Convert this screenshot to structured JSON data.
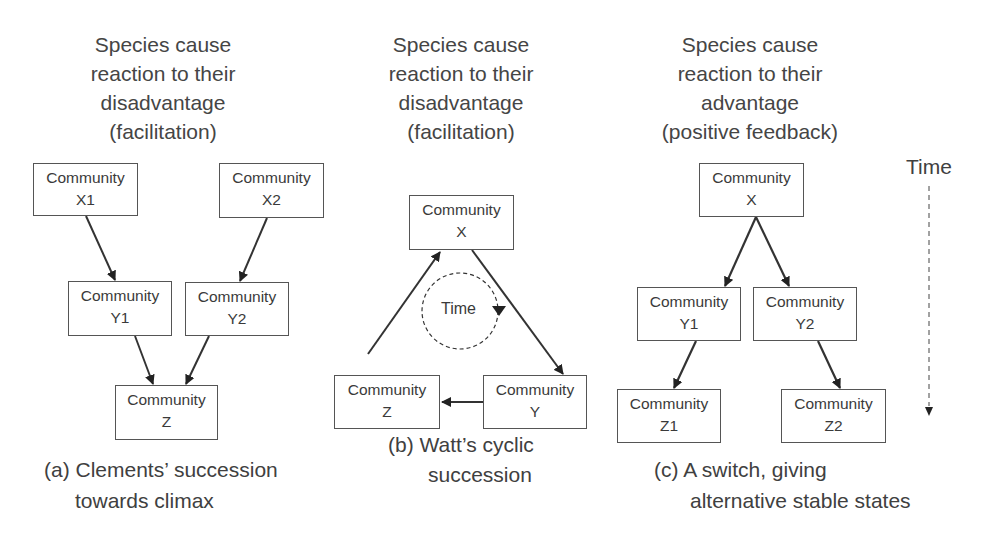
{
  "panels": [
    {
      "id": "a",
      "heading": "Species cause\nreaction to their\ndisadvantage\n(facilitation)",
      "caption_line1": "(a) Clements’ succession",
      "caption_line2": "towards climax",
      "nodes": [
        {
          "id": "X1",
          "title": "Community",
          "label": "X1"
        },
        {
          "id": "X2",
          "title": "Community",
          "label": "X2"
        },
        {
          "id": "Y1",
          "title": "Community",
          "label": "Y1"
        },
        {
          "id": "Y2",
          "title": "Community",
          "label": "Y2"
        },
        {
          "id": "Z",
          "title": "Community",
          "label": "Z"
        }
      ],
      "edges": [
        [
          "X1",
          "Y1"
        ],
        [
          "X2",
          "Y2"
        ],
        [
          "Y1",
          "Z"
        ],
        [
          "Y2",
          "Z"
        ]
      ]
    },
    {
      "id": "b",
      "heading": "Species cause\nreaction to their\ndisadvantage\n(facilitation)",
      "caption_line1": "(b) Watt’s cyclic",
      "caption_line2": "succession",
      "cycle_label": "Time",
      "nodes": [
        {
          "id": "X",
          "title": "Community",
          "label": "X"
        },
        {
          "id": "Z",
          "title": "Community",
          "label": "Z"
        },
        {
          "id": "Y",
          "title": "Community",
          "label": "Y"
        }
      ],
      "edges": [
        [
          "X",
          "Y"
        ],
        [
          "Y",
          "Z"
        ],
        [
          "Z",
          "X"
        ]
      ]
    },
    {
      "id": "c",
      "heading": "Species cause\nreaction to their\nadvantage\n(positive feedback)",
      "caption_line1": "(c) A switch, giving",
      "caption_line2": "alternative stable states",
      "nodes": [
        {
          "id": "X",
          "title": "Community",
          "label": "X"
        },
        {
          "id": "Y1",
          "title": "Community",
          "label": "Y1"
        },
        {
          "id": "Y2",
          "title": "Community",
          "label": "Y2"
        },
        {
          "id": "Z1",
          "title": "Community",
          "label": "Z1"
        },
        {
          "id": "Z2",
          "title": "Community",
          "label": "Z2"
        }
      ],
      "edges": [
        [
          "X",
          "Y1"
        ],
        [
          "X",
          "Y2"
        ],
        [
          "Y1",
          "Z1"
        ],
        [
          "Y2",
          "Z2"
        ]
      ]
    }
  ],
  "time_axis": {
    "label": "Time",
    "direction": "down"
  },
  "colors": {
    "line": "#333333",
    "text": "#404040",
    "box_border": "#555555"
  }
}
